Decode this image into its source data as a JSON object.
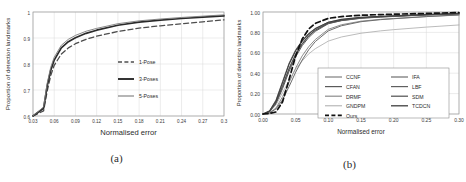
{
  "figure": {
    "panel_a": {
      "caption": "(a)",
      "chart_data": {
        "type": "line",
        "title": "",
        "xlabel": "Normalised error",
        "ylabel": "Proportion of detection landmarks",
        "xlim": [
          0.03,
          0.3
        ],
        "ylim": [
          0.6,
          1.0
        ],
        "xticks": [
          "0.03",
          "0.06",
          "0.09",
          "0.12",
          "0.15",
          "0.18",
          "0.21",
          "0.24",
          "0.27",
          "0.3"
        ],
        "yticks": [
          "0.6",
          "0.7",
          "0.8",
          "0.9",
          "1"
        ],
        "grid": true,
        "legend_position": "center-right",
        "x": [
          0.03,
          0.045,
          0.05,
          0.055,
          0.06,
          0.07,
          0.08,
          0.09,
          0.105,
          0.12,
          0.15,
          0.18,
          0.21,
          0.24,
          0.27,
          0.3
        ],
        "series": [
          {
            "name": "1-Pose",
            "style": "dashed",
            "color": "#4d4d4d",
            "width": 1.3,
            "values": [
              0.6,
              0.62,
              0.695,
              0.755,
              0.795,
              0.838,
              0.862,
              0.878,
              0.895,
              0.907,
              0.925,
              0.938,
              0.947,
              0.955,
              0.962,
              0.97
            ]
          },
          {
            "name": "3-Poses",
            "style": "solid-thick",
            "color": "#2a2a2a",
            "width": 1.7,
            "values": [
              0.6,
              0.63,
              0.715,
              0.775,
              0.815,
              0.862,
              0.886,
              0.901,
              0.918,
              0.93,
              0.949,
              0.961,
              0.969,
              0.975,
              0.98,
              0.985
            ]
          },
          {
            "name": "5-Poses",
            "style": "solid-thin",
            "color": "#7a7a7a",
            "width": 0.9,
            "values": [
              0.6,
              0.635,
              0.725,
              0.787,
              0.826,
              0.872,
              0.895,
              0.91,
              0.926,
              0.937,
              0.955,
              0.966,
              0.973,
              0.979,
              0.984,
              0.989
            ]
          }
        ]
      }
    },
    "panel_b": {
      "caption": "(b)",
      "chart_data": {
        "type": "line",
        "title": "",
        "xlabel": "Normalised error",
        "ylabel": "Proportion of detection landmarks",
        "xlim": [
          0.0,
          0.3
        ],
        "ylim": [
          0.0,
          1.0
        ],
        "xticks": [
          "0.00",
          "0.05",
          "0.10",
          "0.15",
          "0.20",
          "0.25",
          "0.30"
        ],
        "yticks": [
          "0.00",
          "0.20",
          "0.40",
          "0.60",
          "0.80",
          "1.00"
        ],
        "grid": true,
        "legend_position": "lower-right",
        "x": [
          0.0,
          0.01,
          0.02,
          0.03,
          0.04,
          0.05,
          0.06,
          0.07,
          0.08,
          0.1,
          0.12,
          0.15,
          0.18,
          0.2,
          0.25,
          0.3
        ],
        "series": [
          {
            "name": "CCNF",
            "style": "solid",
            "color": "#7f7f7f",
            "width": 1.0,
            "values": [
              0.0,
              0.03,
              0.14,
              0.32,
              0.5,
              0.63,
              0.72,
              0.79,
              0.84,
              0.9,
              0.925,
              0.945,
              0.955,
              0.96,
              0.972,
              0.982
            ]
          },
          {
            "name": "CFAN",
            "style": "solid",
            "color": "#5a5a5a",
            "width": 1.0,
            "values": [
              0.0,
              0.02,
              0.1,
              0.25,
              0.42,
              0.56,
              0.67,
              0.75,
              0.81,
              0.885,
              0.915,
              0.938,
              0.95,
              0.956,
              0.97,
              0.98
            ]
          },
          {
            "name": "DRMF",
            "style": "solid",
            "color": "#8c8c8c",
            "width": 1.0,
            "values": [
              0.0,
              0.01,
              0.06,
              0.17,
              0.31,
              0.45,
              0.57,
              0.66,
              0.73,
              0.83,
              0.875,
              0.91,
              0.928,
              0.936,
              0.955,
              0.97
            ]
          },
          {
            "name": "GNDPM",
            "style": "solid",
            "color": "#aaaaaa",
            "width": 0.8,
            "values": [
              0.0,
              0.02,
              0.09,
              0.21,
              0.33,
              0.44,
              0.52,
              0.59,
              0.64,
              0.715,
              0.755,
              0.792,
              0.815,
              0.827,
              0.852,
              0.873
            ]
          },
          {
            "name": "IFA",
            "style": "solid",
            "color": "#6e6e6e",
            "width": 1.0,
            "values": [
              0.0,
              0.01,
              0.05,
              0.14,
              0.27,
              0.41,
              0.53,
              0.63,
              0.71,
              0.815,
              0.865,
              0.905,
              0.925,
              0.934,
              0.955,
              0.972
            ]
          },
          {
            "name": "LBF",
            "style": "solid",
            "color": "#606060",
            "width": 1.0,
            "values": [
              0.0,
              0.03,
              0.12,
              0.28,
              0.45,
              0.59,
              0.69,
              0.77,
              0.82,
              0.888,
              0.916,
              0.94,
              0.952,
              0.958,
              0.972,
              0.983
            ]
          },
          {
            "name": "SDM",
            "style": "solid",
            "color": "#4f4f4f",
            "width": 1.0,
            "values": [
              0.0,
              0.02,
              0.11,
              0.27,
              0.44,
              0.58,
              0.685,
              0.765,
              0.822,
              0.892,
              0.92,
              0.943,
              0.954,
              0.96,
              0.974,
              0.984
            ]
          },
          {
            "name": "TCDCN",
            "style": "solid",
            "color": "#3f3f3f",
            "width": 1.1,
            "values": [
              0.0,
              0.03,
              0.13,
              0.31,
              0.49,
              0.62,
              0.715,
              0.785,
              0.835,
              0.9,
              0.928,
              0.948,
              0.958,
              0.963,
              0.975,
              0.985
            ]
          },
          {
            "name": "Ours",
            "style": "dashed",
            "color": "#111111",
            "width": 1.7,
            "values": [
              0.0,
              0.005,
              0.02,
              0.12,
              0.34,
              0.57,
              0.735,
              0.833,
              0.888,
              0.938,
              0.955,
              0.968,
              0.975,
              0.978,
              0.986,
              0.995
            ]
          }
        ]
      }
    }
  }
}
